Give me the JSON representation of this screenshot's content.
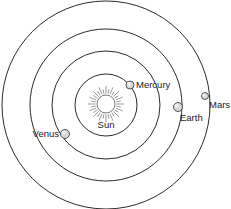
{
  "diagram": {
    "title": "",
    "center": {
      "x": 106,
      "y": 105
    },
    "sun": {
      "label": "Sun",
      "x": 106,
      "y": 104,
      "radius": 9,
      "label_x": 106,
      "label_y": 128
    },
    "orbits": [
      {
        "name": "Mercury",
        "radius": 31
      },
      {
        "name": "Venus",
        "radius": 54
      },
      {
        "name": "Earth",
        "radius": 76
      },
      {
        "name": "Mars",
        "radius": 104
      }
    ],
    "planets": [
      {
        "label": "Mercury",
        "x": 130,
        "y": 85,
        "r": 4,
        "label_x": 136,
        "label_y": 88,
        "anchor": "start"
      },
      {
        "label": "Venus",
        "x": 65,
        "y": 134,
        "r": 4.5,
        "label_x": 59,
        "label_y": 137,
        "anchor": "end"
      },
      {
        "label": "Earth",
        "x": 178,
        "y": 107,
        "r": 4.5,
        "label_x": 180,
        "label_y": 121,
        "anchor": "start"
      },
      {
        "label": "Mars",
        "x": 205,
        "y": 96,
        "r": 3.5,
        "label_x": 209,
        "label_y": 108,
        "anchor": "start"
      }
    ],
    "colors": {
      "stroke": "#2a2a2a",
      "planet_fill": "#d8d8d8",
      "background": "#ffffff"
    }
  }
}
